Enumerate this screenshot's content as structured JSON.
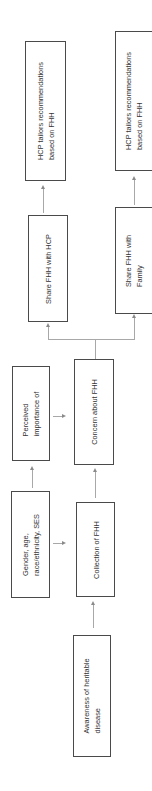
{
  "diagram": {
    "orientation": "rotated -90deg (reads bottom to top)",
    "nodes": {
      "awareness": {
        "lines": [
          "Awareness of heritable",
          "disease"
        ]
      },
      "demographics": {
        "lines": [
          "Gender, age,",
          "race/ethnicity, SES"
        ]
      },
      "collection": {
        "lines": [
          "Collection of FHH"
        ]
      },
      "perceived": {
        "lines": [
          "Perceived",
          "importance of"
        ]
      },
      "concern": {
        "lines": [
          "Concern about FHH"
        ]
      },
      "share_hcp": {
        "lines": [
          "Share FHH with HCP"
        ]
      },
      "share_family": {
        "lines": [
          "Share FHH with",
          "Family"
        ]
      },
      "hcp_tailors_1": {
        "lines": [
          "HCP tailors recommendations",
          "based on FHH"
        ]
      },
      "hcp_tailors_2": {
        "lines": [
          "HCP tailors recommendations",
          "based on FHH"
        ]
      }
    },
    "edges": [
      {
        "from": "awareness",
        "to": "collection"
      },
      {
        "from": "demographics",
        "to": "collection"
      },
      {
        "from": "demographics",
        "to": "perceived"
      },
      {
        "from": "collection",
        "to": "concern"
      },
      {
        "from": "perceived",
        "to": "concern"
      },
      {
        "from": "concern",
        "to": "share_hcp"
      },
      {
        "from": "concern",
        "to": "share_family"
      },
      {
        "from": "share_hcp",
        "to": "hcp_tailors_1"
      },
      {
        "from": "share_family",
        "to": "hcp_tailors_2"
      }
    ],
    "colors": {
      "border": "#4a4a4a",
      "connector": "#a8a8a8",
      "text": "#333333"
    }
  }
}
